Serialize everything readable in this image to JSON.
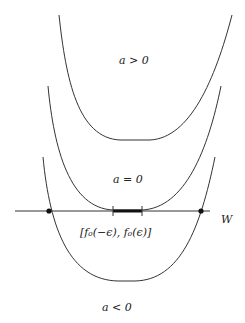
{
  "figure": {
    "labels": {
      "a_pos": "a > 0",
      "a_zero": "a = 0",
      "a_neg": "a < 0",
      "axis": "W",
      "interval": "[f₀(−ϵ),  f₀(ϵ)]"
    },
    "colors": {
      "stroke": "#333333",
      "dot": "#111111",
      "background": "#ffffff"
    }
  }
}
